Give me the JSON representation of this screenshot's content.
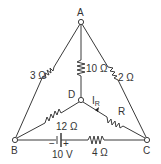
{
  "nodes": {
    "A": "A",
    "B": "B",
    "C": "C",
    "D": "D"
  },
  "resistors": {
    "AB": "3 Ω",
    "AD": "10 Ω",
    "AC": "2 Ω",
    "BD": "12 Ω",
    "DC": "R",
    "BC": "4 Ω"
  },
  "battery": {
    "voltage": "10 V",
    "negative": "−",
    "positive": "+"
  },
  "current": {
    "label": "I",
    "subscript": "R"
  }
}
